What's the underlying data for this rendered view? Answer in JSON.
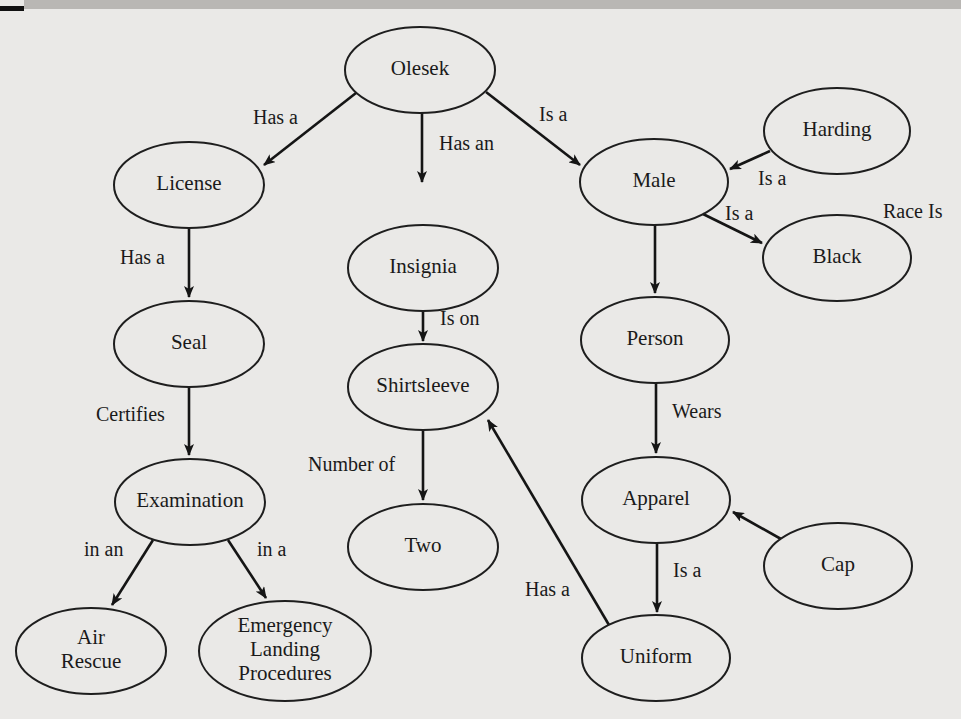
{
  "diagram": {
    "title": "",
    "nodes": [
      {
        "id": "olesek",
        "label": [
          "Olesek"
        ],
        "cx": 420,
        "cy": 70,
        "rx": 75,
        "ry": 43
      },
      {
        "id": "license",
        "label": [
          "License"
        ],
        "cx": 189,
        "cy": 185,
        "rx": 75,
        "ry": 43
      },
      {
        "id": "insignia",
        "label": [
          "Insignia"
        ],
        "cx": 423,
        "cy": 268,
        "rx": 75,
        "ry": 43
      },
      {
        "id": "male",
        "label": [
          "Male"
        ],
        "cx": 654,
        "cy": 182,
        "rx": 74,
        "ry": 43
      },
      {
        "id": "harding",
        "label": [
          "Harding"
        ],
        "cx": 837,
        "cy": 131,
        "rx": 73,
        "ry": 43
      },
      {
        "id": "black",
        "label": [
          "Black"
        ],
        "cx": 837,
        "cy": 258,
        "rx": 74,
        "ry": 43
      },
      {
        "id": "seal",
        "label": [
          "Seal"
        ],
        "cx": 189,
        "cy": 344,
        "rx": 75,
        "ry": 43
      },
      {
        "id": "person",
        "label": [
          "Person"
        ],
        "cx": 655,
        "cy": 340,
        "rx": 74,
        "ry": 43
      },
      {
        "id": "shirtsleeve",
        "label": [
          "Shirtsleeve"
        ],
        "cx": 423,
        "cy": 387,
        "rx": 75,
        "ry": 43
      },
      {
        "id": "apparel",
        "label": [
          "Apparel"
        ],
        "cx": 656,
        "cy": 500,
        "rx": 74,
        "ry": 43
      },
      {
        "id": "examination",
        "label": [
          "Examination"
        ],
        "cx": 190,
        "cy": 502,
        "rx": 75,
        "ry": 43
      },
      {
        "id": "two",
        "label": [
          "Two"
        ],
        "cx": 423,
        "cy": 547,
        "rx": 75,
        "ry": 43
      },
      {
        "id": "cap",
        "label": [
          "Cap"
        ],
        "cx": 838,
        "cy": 566,
        "rx": 74,
        "ry": 43
      },
      {
        "id": "air_rescue",
        "label": [
          "Air",
          "Rescue"
        ],
        "cx": 91,
        "cy": 651,
        "rx": 75,
        "ry": 43
      },
      {
        "id": "emergency",
        "label": [
          "Emergency",
          "Landing",
          "Procedures"
        ],
        "cx": 285,
        "cy": 651,
        "rx": 86,
        "ry": 50
      },
      {
        "id": "uniform",
        "label": [
          "Uniform"
        ],
        "cx": 656,
        "cy": 658,
        "rx": 74,
        "ry": 43
      }
    ],
    "edges": [
      {
        "from": "olesek",
        "to": "license",
        "label": "Has a",
        "x1": 356,
        "y1": 93,
        "x2": 264,
        "y2": 165,
        "arrow": true,
        "lx": 253,
        "ly": 124
      },
      {
        "from": "olesek",
        "to": "insignia",
        "label": "Has an",
        "x1": 422,
        "y1": 113,
        "x2": 422,
        "y2": 182,
        "arrow": true,
        "lx": 439,
        "ly": 150
      },
      {
        "from": "olesek",
        "to": "male",
        "label": "Is a",
        "x1": 486,
        "y1": 92,
        "x2": 580,
        "y2": 165,
        "arrow": true,
        "lx": 539,
        "ly": 121
      },
      {
        "from": "harding",
        "to": "male",
        "label": "Is a",
        "x1": 770,
        "y1": 151,
        "x2": 730,
        "y2": 169,
        "arrow": true,
        "lx": 758,
        "ly": 185
      },
      {
        "from": "male",
        "to": "black",
        "label": "Is a",
        "x1": 703,
        "y1": 214,
        "x2": 762,
        "y2": 243,
        "arrow": true,
        "lx": 725,
        "ly": 220
      },
      {
        "from": "license",
        "to": "seal",
        "label": "Has a",
        "x1": 189,
        "y1": 228,
        "x2": 189,
        "y2": 297,
        "arrow": true,
        "lx": 120,
        "ly": 264
      },
      {
        "from": "insignia",
        "to": "shirtsleeve",
        "label": "Is on",
        "x1": 423,
        "y1": 311,
        "x2": 423,
        "y2": 341,
        "arrow": true,
        "lx": 440,
        "ly": 325
      },
      {
        "from": "male",
        "to": "person",
        "label": "",
        "x1": 655,
        "y1": 225,
        "x2": 655,
        "y2": 293,
        "arrow": true,
        "lx": 0,
        "ly": 0
      },
      {
        "from": "seal",
        "to": "examination",
        "label": "Certifies",
        "x1": 189,
        "y1": 387,
        "x2": 189,
        "y2": 455,
        "arrow": true,
        "lx": 96,
        "ly": 421
      },
      {
        "from": "person",
        "to": "apparel",
        "label": "Wears",
        "x1": 656,
        "y1": 383,
        "x2": 656,
        "y2": 453,
        "arrow": true,
        "lx": 672,
        "ly": 418
      },
      {
        "from": "shirtsleeve",
        "to": "two",
        "label": "Number of",
        "x1": 423,
        "y1": 430,
        "x2": 423,
        "y2": 500,
        "arrow": true,
        "lx": 308,
        "ly": 471
      },
      {
        "from": "uniform",
        "to": "shirtsleeve",
        "label": "Has a",
        "x1": 609,
        "y1": 625,
        "x2": 488,
        "y2": 420,
        "arrow": true,
        "lx": 525,
        "ly": 596
      },
      {
        "from": "cap",
        "to": "apparel",
        "label": "",
        "x1": 781,
        "y1": 539,
        "x2": 733,
        "y2": 512,
        "arrow": true,
        "lx": 0,
        "ly": 0
      },
      {
        "from": "apparel",
        "to": "uniform",
        "label": "Is a",
        "x1": 657,
        "y1": 543,
        "x2": 657,
        "y2": 612,
        "arrow": true,
        "lx": 673,
        "ly": 577
      },
      {
        "from": "examination",
        "to": "air_rescue",
        "label": "in an",
        "x1": 153,
        "y1": 540,
        "x2": 112,
        "y2": 605,
        "arrow": true,
        "lx": 84,
        "ly": 556
      },
      {
        "from": "examination",
        "to": "emergency",
        "label": "in a",
        "x1": 228,
        "y1": 540,
        "x2": 266,
        "y2": 598,
        "arrow": true,
        "lx": 257,
        "ly": 556
      }
    ],
    "free_labels": [
      {
        "id": "race_is",
        "text": "Race Is",
        "x": 883,
        "y": 218
      }
    ]
  },
  "colors": {
    "background": "#eae9e7",
    "stroke": "#1e1e1e",
    "text": "#1a1a1a"
  }
}
